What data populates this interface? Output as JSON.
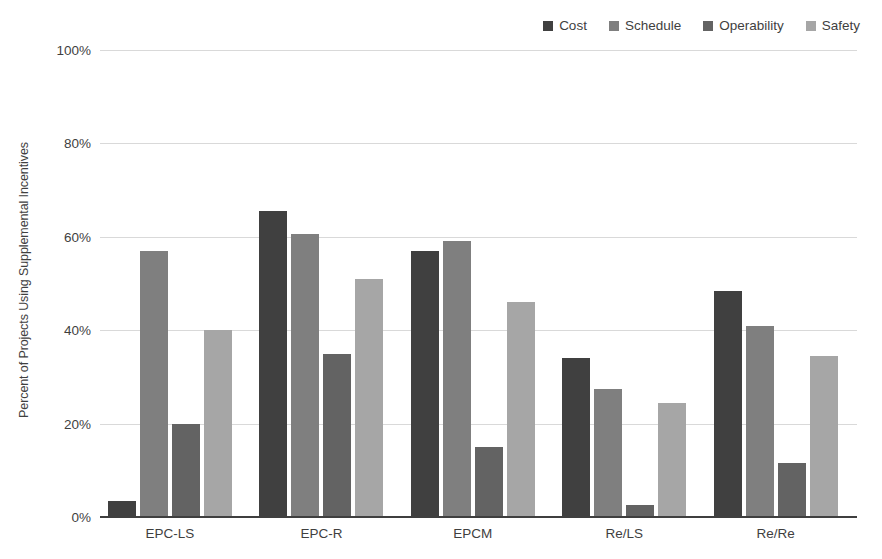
{
  "chart_data": {
    "type": "bar",
    "title": "",
    "xlabel": "",
    "ylabel": "Percent of Projects Using Supplemental Incentives",
    "ylim": [
      0,
      100
    ],
    "ytick_labels": [
      "100%",
      "80%",
      "60%",
      "40%",
      "20%",
      "0%"
    ],
    "ytick_values": [
      100,
      80,
      60,
      40,
      20,
      0
    ],
    "grid": true,
    "legend_position": "top-right",
    "categories": [
      "EPC-LS",
      "EPC-R",
      "EPCM",
      "Re/LS",
      "Re/Re"
    ],
    "series": [
      {
        "name": "Cost",
        "color": "#404040",
        "values": [
          3.5,
          65.5,
          57.0,
          34.0,
          48.5
        ]
      },
      {
        "name": "Schedule",
        "color": "#7f7f7f",
        "values": [
          57.0,
          60.5,
          59.0,
          27.5,
          41.0
        ]
      },
      {
        "name": "Operability",
        "color": "#636363",
        "values": [
          20.0,
          35.0,
          15.0,
          2.5,
          11.5
        ]
      },
      {
        "name": "Safety",
        "color": "#a6a6a6",
        "values": [
          40.0,
          51.0,
          46.0,
          24.5,
          34.5
        ]
      }
    ]
  },
  "legend": {
    "items": [
      {
        "label": "Cost",
        "color": "#404040"
      },
      {
        "label": "Schedule",
        "color": "#7f7f7f"
      },
      {
        "label": "Operability",
        "color": "#636363"
      },
      {
        "label": "Safety",
        "color": "#a6a6a6"
      }
    ]
  },
  "axes": {
    "y_title": "Percent of Projects Using Supplemental Incentives"
  }
}
